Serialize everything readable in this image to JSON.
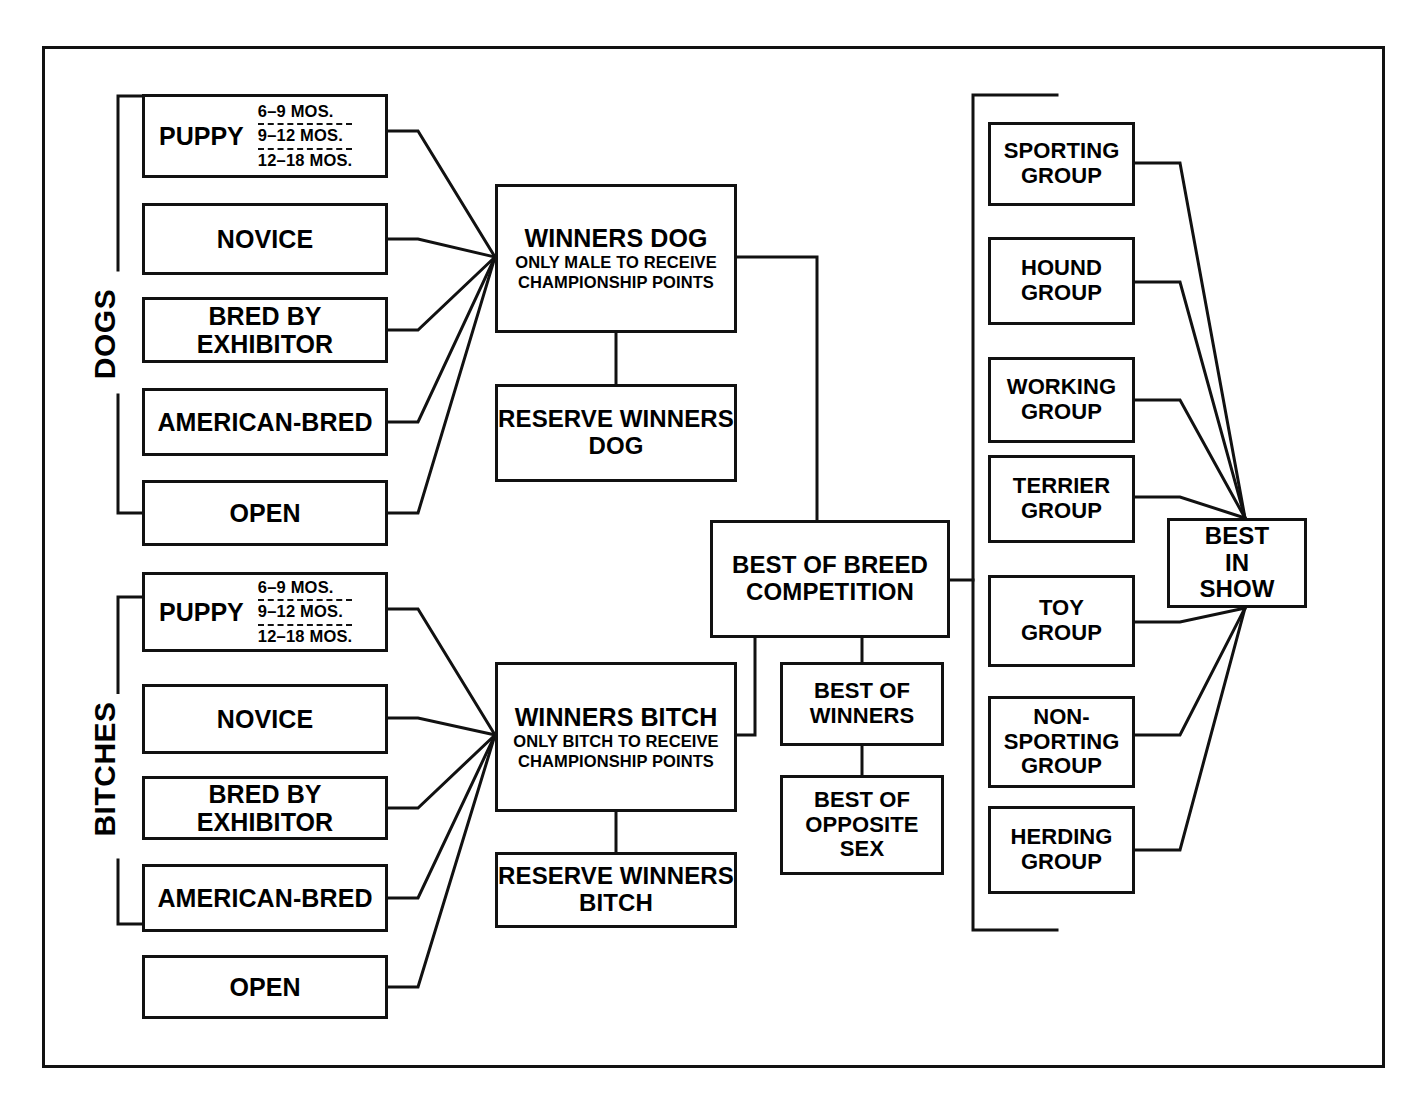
{
  "diagram": {
    "type": "flowchart",
    "sections": {
      "dogs_label": "DOGS",
      "bitches_label": "BITCHES"
    },
    "puppy_ages": [
      "6–9 MOS.",
      "9–12 MOS.",
      "12–18 MOS."
    ],
    "dog_classes": [
      {
        "name": "PUPPY"
      },
      {
        "name": "NOVICE"
      },
      {
        "name": "BRED BY EXHIBITOR"
      },
      {
        "name": "AMERICAN-BRED"
      },
      {
        "name": "OPEN"
      }
    ],
    "bitch_classes": [
      {
        "name": "PUPPY"
      },
      {
        "name": "NOVICE"
      },
      {
        "name": "BRED BY EXHIBITOR"
      },
      {
        "name": "AMERICAN-BRED"
      },
      {
        "name": "OPEN"
      }
    ],
    "winners_dog": {
      "title": "WINNERS DOG",
      "subtitle": "ONLY MALE TO RECEIVE\nCHAMPIONSHIP POINTS"
    },
    "reserve_winners_dog": {
      "title": "RESERVE WINNERS\nDOG"
    },
    "winners_bitch": {
      "title": "WINNERS BITCH",
      "subtitle": "ONLY BITCH TO RECEIVE\nCHAMPIONSHIP POINTS"
    },
    "reserve_winners_bitch": {
      "title": "RESERVE WINNERS\nBITCH"
    },
    "best_of_breed": {
      "title": "BEST OF BREED\nCOMPETITION"
    },
    "best_of_winners": {
      "title": "BEST OF\nWINNERS"
    },
    "best_of_opposite_sex": {
      "title": "BEST OF\nOPPOSITE\nSEX"
    },
    "groups": [
      {
        "name": "SPORTING\nGROUP"
      },
      {
        "name": "HOUND\nGROUP"
      },
      {
        "name": "WORKING\nGROUP"
      },
      {
        "name": "TERRIER\nGROUP"
      },
      {
        "name": "TOY\nGROUP"
      },
      {
        "name": "NON-\nSPORTING\nGROUP"
      },
      {
        "name": "HERDING\nGROUP"
      }
    ],
    "best_in_show": {
      "title": "BEST\nIN\nSHOW"
    },
    "colors": {
      "line": "#111111",
      "background": "#ffffff",
      "text": "#000000"
    }
  }
}
